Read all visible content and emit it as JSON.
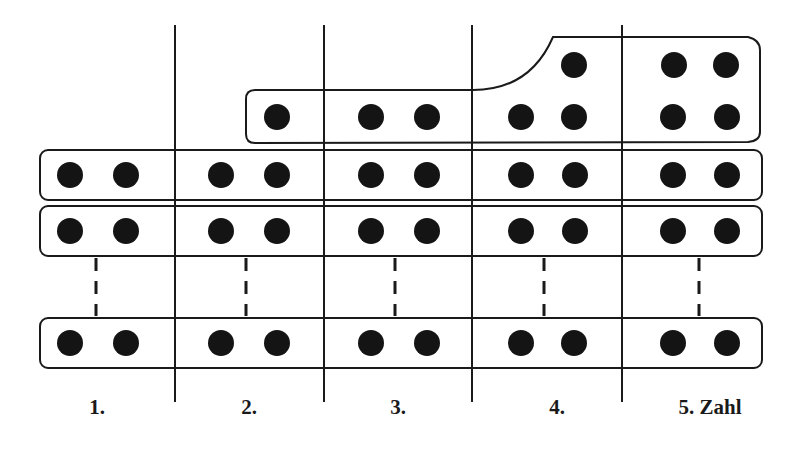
{
  "diagram": {
    "columns": [
      {
        "label": "1.",
        "top_dots": 0
      },
      {
        "label": "2.",
        "top_dots": 1
      },
      {
        "label": "3.",
        "top_dots": 2
      },
      {
        "label": "4.",
        "top_dots": 3
      },
      {
        "label": "5. Zahl",
        "top_dots": 4
      }
    ],
    "rows": [
      "row-1",
      "row-2",
      "ellipsis",
      "row-n"
    ],
    "colors": {
      "ink": "#141414",
      "background": "#ffffff"
    }
  }
}
